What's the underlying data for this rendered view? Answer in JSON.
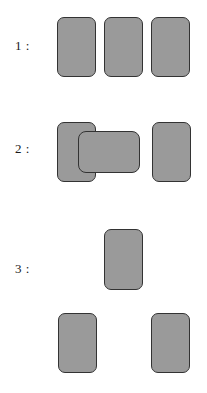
{
  "figure": {
    "width": 207,
    "height": 393,
    "background_color": "#ffffff",
    "shape_fill_color": "#9a9a9a",
    "shape_border_color": "#333333",
    "label_color": "#1a1a1a"
  },
  "rows": [
    {
      "label": "1 :",
      "label_x": 15,
      "label_y": 39,
      "shapes": [
        {
          "name": "card-1-1",
          "x": 57,
          "y": 17,
          "w": 39,
          "h": 60,
          "orientation": "portrait",
          "overlapping": false
        },
        {
          "name": "card-1-2",
          "x": 104,
          "y": 17,
          "w": 39,
          "h": 60,
          "orientation": "portrait",
          "overlapping": false
        },
        {
          "name": "card-1-3",
          "x": 151,
          "y": 17,
          "w": 39,
          "h": 60,
          "orientation": "portrait",
          "overlapping": false
        }
      ]
    },
    {
      "label": "2 :",
      "label_x": 15,
      "label_y": 142,
      "shapes": [
        {
          "name": "card-2-1",
          "x": 57,
          "y": 122,
          "w": 39,
          "h": 60,
          "orientation": "portrait",
          "overlapping": false
        },
        {
          "name": "card-2-2",
          "x": 78,
          "y": 131,
          "w": 62,
          "h": 42,
          "orientation": "landscape",
          "overlapping": true
        },
        {
          "name": "card-2-3",
          "x": 152,
          "y": 122,
          "w": 39,
          "h": 60,
          "orientation": "portrait",
          "overlapping": false
        }
      ]
    },
    {
      "label": "3 :",
      "label_x": 15,
      "label_y": 262,
      "shapes": [
        {
          "name": "card-3-1",
          "x": 104,
          "y": 229,
          "w": 39,
          "h": 61,
          "orientation": "portrait",
          "overlapping": false
        },
        {
          "name": "card-3-2",
          "x": 58,
          "y": 313,
          "w": 39,
          "h": 60,
          "orientation": "portrait",
          "overlapping": false
        },
        {
          "name": "card-3-3",
          "x": 151,
          "y": 313,
          "w": 39,
          "h": 60,
          "orientation": "portrait",
          "overlapping": false
        }
      ]
    }
  ]
}
